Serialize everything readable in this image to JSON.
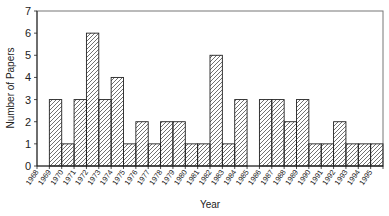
{
  "chart_data": {
    "type": "bar",
    "title": "",
    "xlabel": "Year",
    "ylabel": "Number of Papers",
    "ylim": [
      0,
      7
    ],
    "yticks": [
      0,
      1,
      2,
      3,
      4,
      5,
      6,
      7
    ],
    "grid": false,
    "legend": null,
    "fill_pattern": "diagonal-hatch",
    "categories": [
      "1968",
      "1969",
      "1970",
      "1971",
      "1972",
      "1973",
      "1974",
      "1975",
      "1976",
      "1977",
      "1978",
      "1979",
      "1980",
      "1981",
      "1982",
      "1983",
      "1984",
      "1985",
      "1986",
      "1987",
      "1988",
      "1989",
      "1990",
      "1991",
      "1992",
      "1993",
      "1994",
      "1995"
    ],
    "values": [
      0,
      3,
      1,
      3,
      6,
      3,
      4,
      1,
      2,
      1,
      2,
      2,
      1,
      1,
      5,
      1,
      3,
      0,
      3,
      3,
      2,
      3,
      1,
      1,
      2,
      1,
      1,
      1
    ]
  },
  "colors": {
    "bar_stroke": "#222222",
    "hatch": "#333333",
    "axis": "#555555",
    "frame": "#777777"
  }
}
